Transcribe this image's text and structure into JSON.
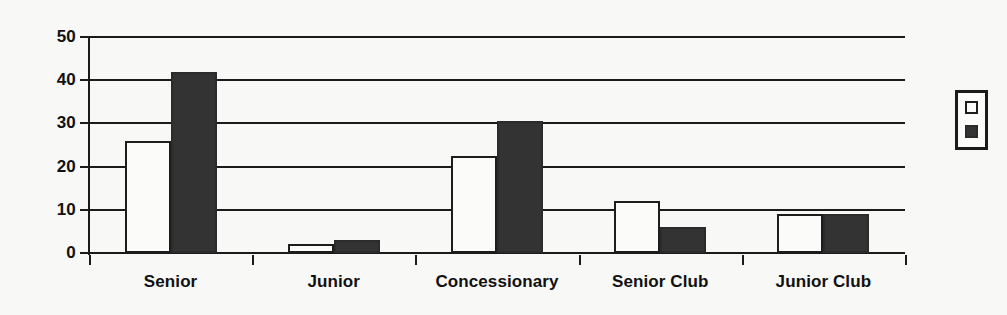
{
  "chart_data": {
    "type": "bar",
    "title": "",
    "subtitle": "",
    "xlabel": "",
    "ylabel": "",
    "ylim": [
      0,
      50
    ],
    "yticks": [
      0,
      10,
      20,
      30,
      40,
      50
    ],
    "ytick_labels": [
      "0",
      "10",
      "20",
      "30",
      "40",
      "50"
    ],
    "grid": true,
    "grid_axis": "y",
    "legend_position": "right",
    "categories": [
      "Senior",
      "Junior",
      "Concessionary",
      "Senior Club",
      "Junior Club"
    ],
    "series": [
      {
        "name": "",
        "swatch": "light",
        "color": "#fbfbf9",
        "values": [
          26,
          2,
          22.5,
          12,
          9
        ]
      },
      {
        "name": "",
        "swatch": "dark",
        "color": "#333333",
        "values": [
          42,
          3,
          30.5,
          6,
          9
        ]
      }
    ],
    "annotations": []
  },
  "legend": {
    "items": [
      {
        "swatch": "light",
        "label": ""
      },
      {
        "swatch": "dark",
        "label": ""
      }
    ]
  },
  "style": {
    "background": "#f8f8f6",
    "axis_color": "#1b1b1b",
    "light_fill": "#fbfbf9",
    "dark_fill": "#333333",
    "text_color": "#111111"
  }
}
